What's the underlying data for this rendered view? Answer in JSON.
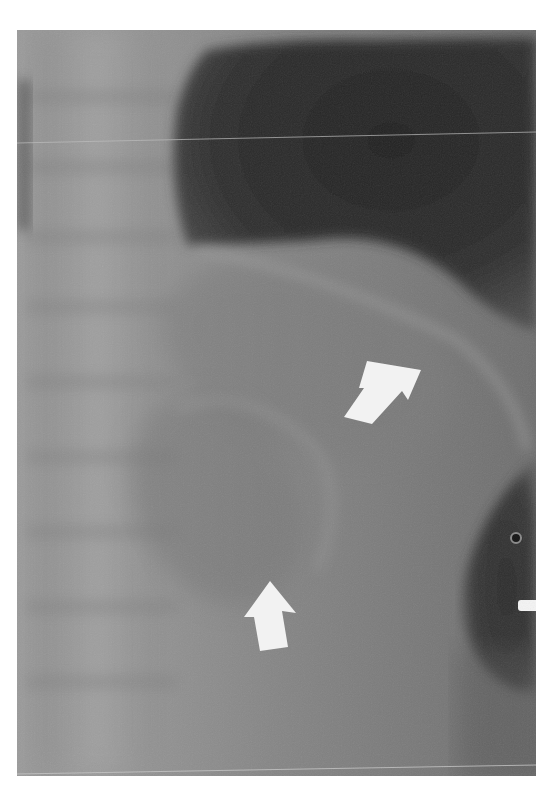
{
  "image": {
    "type": "radiograph",
    "description": "Grayscale X-ray of the left upper abdomen / lower chest with spine on the left, dark gas-filled region at top right, and a dark rounded gas shadow with a small metallic marker at lower right.",
    "annotations": [
      {
        "kind": "arrow",
        "direction": "down-left",
        "color": "#f2f2f2"
      },
      {
        "kind": "arrow",
        "direction": "up",
        "color": "#f2f2f2"
      }
    ],
    "colors": {
      "page_background": "#ffffff",
      "film_mid_gray": "#8a8a8a",
      "dark_air": "#2a2a2a",
      "arrow_white": "#f2f2f2"
    }
  }
}
